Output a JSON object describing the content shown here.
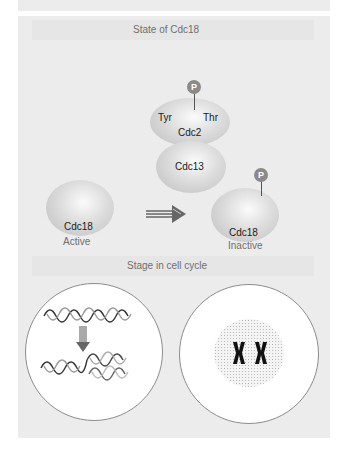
{
  "sections": {
    "state_title": "State of Cdc18",
    "stage_title": "Stage in cell cycle"
  },
  "complex": {
    "cdc2": {
      "label": "Cdc2",
      "site_left": "Tyr",
      "site_right": "Thr",
      "phospho": "P"
    },
    "cdc13": {
      "label": "Cdc13"
    }
  },
  "cdc18_active": {
    "label": "Cdc18",
    "state": "Active"
  },
  "cdc18_inactive": {
    "label": "Cdc18",
    "state": "Inactive",
    "phospho": "P"
  },
  "colors": {
    "panel": "#ececec",
    "band": "#e6e6e6",
    "protein": "#cfcfcf",
    "phosphate": "#8a8a8a",
    "cell": "#ffffff"
  }
}
